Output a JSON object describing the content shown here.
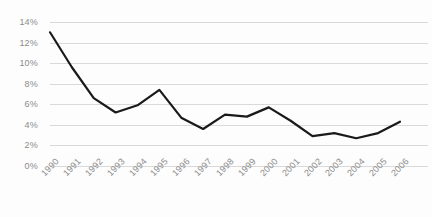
{
  "chart_data": {
    "type": "line",
    "title": "",
    "subtitle": "",
    "xlabel": "",
    "ylabel": "",
    "categories": [
      "1990",
      "1991",
      "1992",
      "1993",
      "1994",
      "1995",
      "1996",
      "1997",
      "1998",
      "1999",
      "2000",
      "2001",
      "2002",
      "2003",
      "2004",
      "2005",
      "2006"
    ],
    "values": [
      13.0,
      9.6,
      6.6,
      5.2,
      5.9,
      7.4,
      4.7,
      3.6,
      5.0,
      4.8,
      5.7,
      4.4,
      2.9,
      3.2,
      2.7,
      3.2,
      4.3
    ],
    "series": [
      {
        "name": "",
        "values": [
          13.0,
          9.6,
          6.6,
          5.2,
          5.9,
          7.4,
          4.7,
          3.6,
          5.0,
          4.8,
          5.7,
          4.4,
          2.9,
          3.2,
          2.7,
          3.2,
          4.3
        ]
      }
    ],
    "ylim": [
      0,
      14
    ],
    "ytick_values": [
      0,
      2,
      4,
      6,
      8,
      10,
      12,
      14
    ],
    "ytick_labels": [
      "0%",
      "2%",
      "4%",
      "6%",
      "8%",
      "10%",
      "12%",
      "14%"
    ],
    "value_suffix": "%",
    "grid": true,
    "grid_axis": "y",
    "legend": false,
    "legend_position": "none",
    "xtick_rotation": -45,
    "colors": {
      "line": "#1a1a1a",
      "gridline": "#d9d9d9",
      "tick_label": "#8c8c8c",
      "background": "#fdfdfd"
    }
  }
}
